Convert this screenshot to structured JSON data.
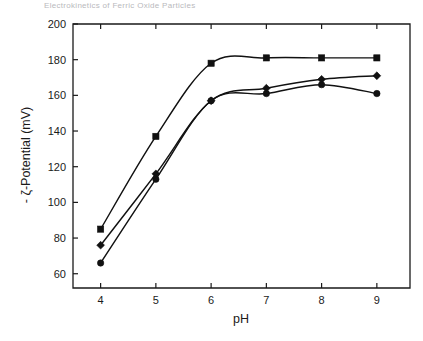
{
  "page": {
    "cropped_header_text": "Electrokinetics of Ferric Oxide Particles"
  },
  "chart_data": {
    "type": "line",
    "title": "",
    "xlabel": "pH",
    "ylabel": "- ζ-Potential (mV)",
    "x": [
      4,
      5,
      6,
      7,
      8,
      9
    ],
    "xlim": [
      3.5,
      9.6
    ],
    "ylim": [
      52,
      200
    ],
    "xticks": [
      4,
      5,
      6,
      7,
      8,
      9
    ],
    "xticklabels": [
      "4",
      "5",
      "6",
      "7",
      "8",
      "9"
    ],
    "yticks": [
      60,
      80,
      100,
      120,
      140,
      160,
      180,
      200
    ],
    "yticklabels": [
      "60",
      "80",
      "100",
      "120",
      "140",
      "160",
      "180",
      "200"
    ],
    "grid": false,
    "legend": "none",
    "series": [
      {
        "name": "series-square",
        "marker": "square",
        "values": [
          85,
          137,
          178,
          181,
          181,
          181
        ]
      },
      {
        "name": "series-diamond",
        "marker": "diamond",
        "values": [
          76,
          116,
          157,
          164,
          169,
          171
        ]
      },
      {
        "name": "series-circle",
        "marker": "circle",
        "values": [
          66,
          113,
          157,
          161,
          166,
          161
        ]
      }
    ]
  }
}
